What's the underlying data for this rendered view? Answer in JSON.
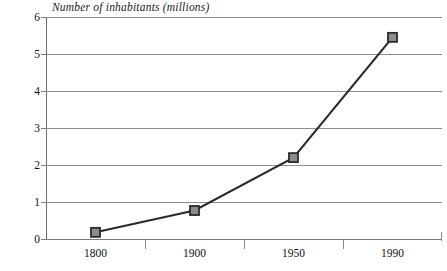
{
  "chart_data": {
    "type": "line",
    "title": "Number of inhabitants (millions)",
    "xlabel": "",
    "ylabel": "",
    "categories": [
      "1800",
      "1900",
      "1950",
      "1990"
    ],
    "values": [
      0.18,
      0.77,
      2.2,
      5.45
    ],
    "series": [
      {
        "name": "Number of inhabitants (millions)",
        "values": [
          0.18,
          0.77,
          2.2,
          5.45
        ]
      }
    ],
    "ylim": [
      0,
      6
    ],
    "y_ticks": [
      0,
      1,
      2,
      3,
      4,
      5,
      6
    ],
    "y_tick_labels": [
      "0",
      "1",
      "2",
      "3",
      "4",
      "5",
      "6"
    ],
    "x_tick_labels": [
      "1800",
      "1900",
      "1950",
      "1990"
    ],
    "grid": "horizontal",
    "legend": "none",
    "marker": "square",
    "colors": {
      "line": "#2b2b2b",
      "marker_fill": "#8c8c8c",
      "marker_edge": "#2b2b2b",
      "gridline": "#8e8e8e",
      "axis": "#6f6f6f",
      "text": "#111111",
      "background": "#ffffff"
    }
  }
}
